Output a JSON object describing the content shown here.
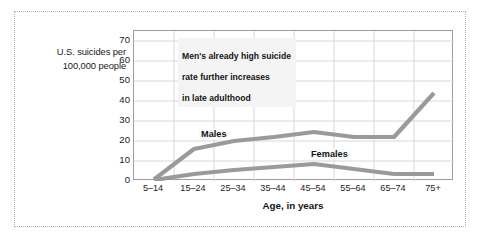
{
  "figure": {
    "frame_style": "dotted-border"
  },
  "chart_data": {
    "type": "line",
    "title": "",
    "subtitle": "",
    "xlabel": "Age, in years",
    "ylabel": "U.S. suicides per 100,000 people",
    "ylabel_line1": "U.S. suicides per",
    "ylabel_line2": "100,000 people",
    "categories": [
      "5–14",
      "15–24",
      "25–34",
      "35–44",
      "45–54",
      "55–64",
      "65–74",
      "75+"
    ],
    "series": [
      {
        "name": "Males",
        "values": [
          0.8,
          16,
          20,
          22,
          24.5,
          22,
          22,
          44
        ],
        "color": "#9a9a9a"
      },
      {
        "name": "Females",
        "values": [
          0.5,
          3.5,
          5.5,
          7,
          8.5,
          6,
          3.5,
          3.5
        ],
        "color": "#9a9a9a"
      }
    ],
    "ylim": [
      0,
      75
    ],
    "yticks": [
      0,
      10,
      20,
      30,
      40,
      50,
      60,
      70
    ],
    "ytick_labels": [
      "0",
      "10",
      "20",
      "30",
      "40",
      "50",
      "60",
      "70"
    ],
    "grid": true,
    "grid_color": "#d8d8d8",
    "legend": "inline-series-labels",
    "legend_position": "inline",
    "annotations": [
      {
        "text": "Men's already high suicide\nrate further increases\nin late adulthood",
        "line1": "Men's already high suicide",
        "line2": "rate further increases",
        "line3": "in late adulthood"
      }
    ],
    "axis_color": "#9d9d9d",
    "background": "#ffffff"
  }
}
